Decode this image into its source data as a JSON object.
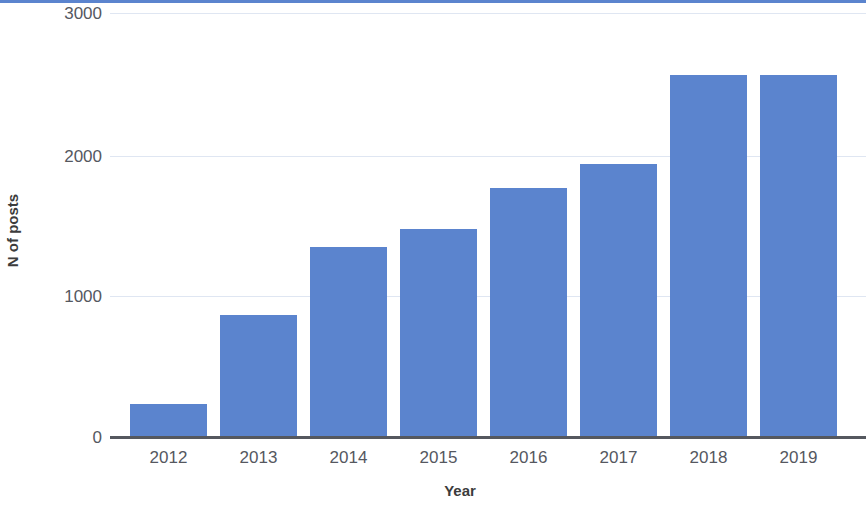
{
  "chart_data": {
    "type": "bar",
    "title": "",
    "xlabel": "Year",
    "ylabel": "N of posts",
    "categories": [
      "2012",
      "2013",
      "2014",
      "2015",
      "2016",
      "2017",
      "2018",
      "2019"
    ],
    "values": [
      20,
      230,
      860,
      1340,
      1470,
      1760,
      1930,
      2560
    ],
    "series": [
      {
        "name": "N of posts",
        "values": [
          20,
          230,
          860,
          1340,
          1470,
          1760,
          1930,
          2560
        ]
      }
    ],
    "ylim": [
      0,
      3000
    ],
    "y_ticks": [
      0,
      1000,
      2000,
      3000
    ],
    "y_tick_labels": [
      "0",
      "1000",
      "2000",
      "3000"
    ],
    "grid": true,
    "legend": "none",
    "bar_color": "#5b84ce",
    "gridline_color": "#dfe6f2",
    "axis_color": "#55585f",
    "background_color": "#ffffff"
  }
}
